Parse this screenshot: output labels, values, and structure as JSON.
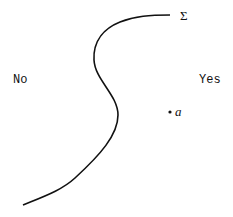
{
  "diagram": {
    "surface_label": "Σ",
    "left_region_label": "No",
    "right_region_label": "Yes",
    "point_label": "a",
    "ink_color": "#111111"
  }
}
